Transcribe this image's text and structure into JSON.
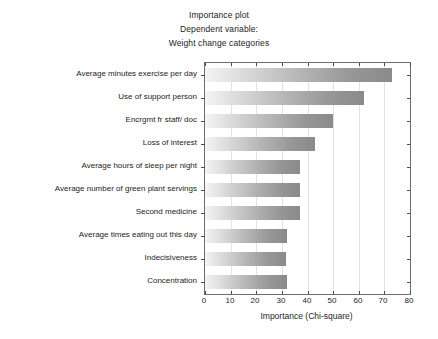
{
  "titles": {
    "line1": "Importance plot",
    "line2": "Dependent variable:",
    "line3": "Weight change categories"
  },
  "chart_data": {
    "type": "bar",
    "orientation": "horizontal",
    "title": "Importance plot",
    "subtitle": "Dependent variable:",
    "subtitle2": "Weight change categories",
    "xlabel": "Importance (Chi-square)",
    "ylabel": "",
    "xlim": [
      0,
      80
    ],
    "xticks": [
      0,
      10,
      20,
      30,
      40,
      50,
      60,
      70,
      80
    ],
    "grid": "vertical",
    "legend": "none",
    "bar_fill": "horizontal-gradient-light-to-dark-gray",
    "categories": [
      "Average minutes exercise per day",
      "Use of support person",
      "Encrgmt fr staff/ doc",
      "Loss of interest",
      "Average hours of sleep per night",
      "Average number of green plant servings",
      "Second medicine",
      "Average times eating out this day",
      "Indecisiveness",
      "Concentration"
    ],
    "values": [
      73,
      62,
      50,
      43,
      37,
      37,
      37,
      32,
      31.5,
      32
    ]
  },
  "colors": {
    "gradient_start": "#f4f4f4",
    "gradient_end": "#8a8a8a",
    "frame": "#6e6e6e",
    "gridline": "#e2e2e2",
    "text": "#1d1d1d"
  }
}
